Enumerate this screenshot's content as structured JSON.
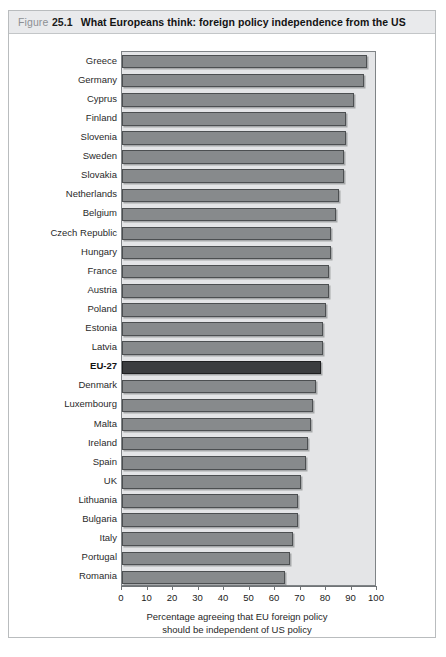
{
  "figure": {
    "label_word": "Figure",
    "number": "25.1",
    "title": "What Europeans think: foreign policy independence from the US"
  },
  "colors": {
    "bar": "#878a8c",
    "bar_border": "#4c4f51",
    "highlight_bar": "#3b3d3f",
    "plot_background": "#e4e5e7",
    "header_background": "#e9eaec",
    "frame_border": "#b9bcbe"
  },
  "axis_caption": {
    "line1": "Percentage agreeing that EU foreign policy",
    "line2": "should be independent of US policy"
  },
  "chart_data": {
    "type": "bar",
    "orientation": "horizontal",
    "title": "What Europeans think: foreign policy independence from the US",
    "xlabel": "Percentage agreeing that EU foreign policy should be independent of US policy",
    "ylabel": "",
    "xlim": [
      0,
      100
    ],
    "xticks": [
      0,
      10,
      20,
      30,
      40,
      50,
      60,
      70,
      80,
      90,
      100
    ],
    "grid": false,
    "legend": false,
    "highlight_category": "EU-27",
    "categories": [
      "Greece",
      "Germany",
      "Cyprus",
      "Finland",
      "Slovenia",
      "Sweden",
      "Slovakia",
      "Netherlands",
      "Belgium",
      "Czech Republic",
      "Hungary",
      "France",
      "Austria",
      "Poland",
      "Estonia",
      "Latvia",
      "EU-27",
      "Denmark",
      "Luxembourg",
      "Malta",
      "Ireland",
      "Spain",
      "UK",
      "Lithuania",
      "Bulgaria",
      "Italy",
      "Portugal",
      "Romania"
    ],
    "values": [
      96,
      95,
      91,
      88,
      88,
      87,
      87,
      85,
      84,
      82,
      82,
      81,
      81,
      80,
      79,
      79,
      78,
      76,
      75,
      74,
      73,
      72,
      70,
      69,
      69,
      67,
      66,
      64
    ]
  }
}
